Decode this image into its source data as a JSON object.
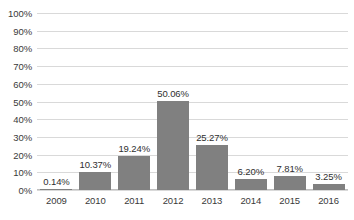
{
  "chart_data": {
    "type": "bar",
    "title": "",
    "subtitle": "",
    "xlabel": "",
    "ylabel": "",
    "categories": [
      "2009",
      "2010",
      "2011",
      "2012",
      "2013",
      "2014",
      "2015",
      "2016"
    ],
    "values": [
      0.14,
      10.37,
      19.24,
      50.06,
      25.27,
      6.2,
      7.81,
      3.25
    ],
    "data_labels": [
      "0.14%",
      "10.37%",
      "19.24%",
      "50.06%",
      "25.27%",
      "6.20%",
      "7.81%",
      "3.25%"
    ],
    "ylim": [
      0,
      100
    ],
    "y_tick_values": [
      100,
      90,
      80,
      70,
      60,
      50,
      40,
      30,
      20,
      10,
      0
    ],
    "y_tick_labels": [
      "100%",
      "90%",
      "80%",
      "70%",
      "60%",
      "50%",
      "40%",
      "30%",
      "20%",
      "10%",
      "0%"
    ],
    "grid": true,
    "legend": false,
    "legend_position": "none",
    "series": [
      {
        "name": "",
        "values": [
          0.14,
          10.37,
          19.24,
          50.06,
          25.27,
          6.2,
          7.81,
          3.25
        ]
      }
    ],
    "colors": {
      "bar": "#808080",
      "gridline": "#d9d9d9",
      "axis": "#bfbfbf",
      "text": "#3a3a3a",
      "data_label": "#2f2f2f",
      "background": "#ffffff"
    }
  }
}
